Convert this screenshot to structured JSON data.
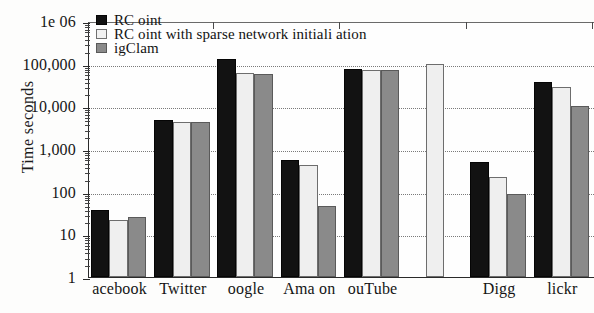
{
  "chart_data": {
    "type": "bar",
    "title": "",
    "xlabel": "",
    "ylabel": "Time  seconds",
    "yscale": "log",
    "ylim": [
      1,
      1000000
    ],
    "grid": true,
    "legend_position": "top-left",
    "ytick_labels": [
      "1",
      "10",
      "100",
      "1,000",
      "10,000",
      "100,000",
      "1e 06"
    ],
    "ytick_values": [
      1,
      10,
      100,
      1000,
      10000,
      100000,
      1000000
    ],
    "categories": [
      "acebook",
      "Twitter",
      "oogle",
      "Ama on",
      "ouTube",
      "",
      "Digg",
      "lickr"
    ],
    "series": [
      {
        "name": "RC  oint",
        "color": "#121212",
        "values": [
          37,
          4700,
          130000,
          560,
          75000,
          null,
          500,
          37000
        ]
      },
      {
        "name": "RC  oint with sparse network initiali ation",
        "color": "#efefef",
        "values": [
          22,
          4400,
          60000,
          430,
          73000,
          100000,
          215,
          28000
        ]
      },
      {
        "name": "igClam",
        "color": "#8a8a8a",
        "values": [
          26,
          4400,
          58000,
          47,
          72000,
          null,
          90,
          10000
        ]
      }
    ]
  }
}
